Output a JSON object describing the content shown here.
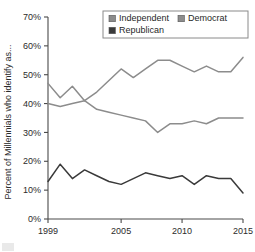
{
  "chart_data": {
    "type": "line",
    "title": "",
    "xlabel": "",
    "ylabel": "Percent of Millennials who identify as...",
    "xlim": [
      1999,
      2015
    ],
    "ylim": [
      0,
      70
    ],
    "grid": false,
    "legend_position": "top-right",
    "x": [
      1999,
      2000,
      2001,
      2002,
      2003,
      2004,
      2005,
      2006,
      2007,
      2008,
      2009,
      2010,
      2011,
      2012,
      2013,
      2014,
      2015
    ],
    "xticks": [
      "1999",
      "2005",
      "2010",
      "2015"
    ],
    "xtick_values": [
      1999,
      2005,
      2010,
      2015
    ],
    "yticks": [
      "0%",
      "10%",
      "20%",
      "30%",
      "40%",
      "50%",
      "60%",
      "70%"
    ],
    "ytick_values": [
      0,
      10,
      20,
      30,
      40,
      50,
      60,
      70
    ],
    "series": [
      {
        "name": "Independent",
        "color": "#8c8c8c",
        "values": [
          47,
          42,
          46,
          41,
          44,
          48,
          52,
          49,
          52,
          55,
          55,
          53,
          51,
          53,
          51,
          51,
          56
        ]
      },
      {
        "name": "Democrat",
        "color": "#8c8c8c",
        "values": [
          40,
          39,
          40,
          41,
          38,
          37,
          36,
          35,
          34,
          30,
          33,
          33,
          34,
          33,
          35,
          35,
          35
        ]
      },
      {
        "name": "Republican",
        "color": "#3a3a3a",
        "values": [
          13,
          19,
          14,
          17,
          15,
          13,
          12,
          14,
          16,
          15,
          14,
          15,
          12,
          15,
          14,
          14,
          9
        ]
      }
    ]
  },
  "legend": {
    "items": [
      {
        "label": "Independent",
        "swatch_color": "#8c8c8c"
      },
      {
        "label": "Democrat",
        "swatch_color": "#8c8c8c"
      },
      {
        "label": "Republican",
        "swatch_color": "#3a3a3a"
      }
    ]
  },
  "axes": {
    "y_title": "Percent of Millennials who identify as...",
    "y_labels": [
      "70%",
      "60%",
      "50%",
      "40%",
      "30%",
      "20%",
      "10%",
      "0%"
    ],
    "x_labels": [
      "1999",
      "2005",
      "2010",
      "2015"
    ]
  }
}
